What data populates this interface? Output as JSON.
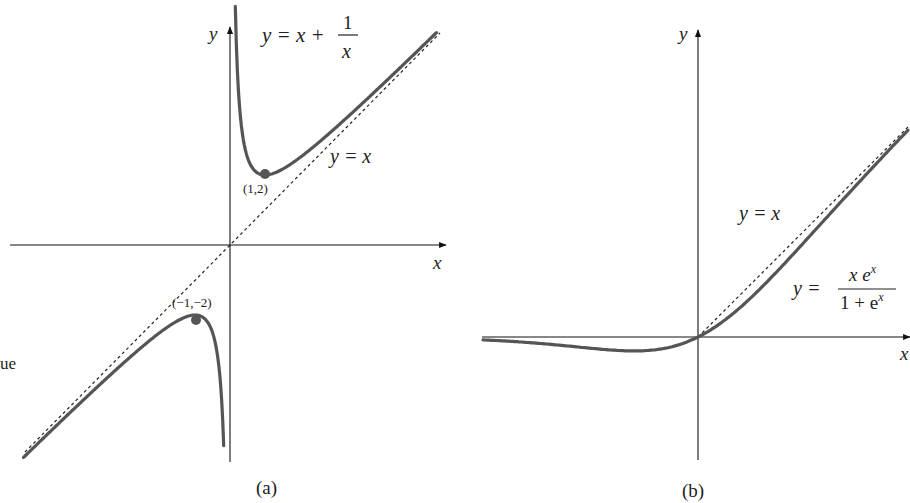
{
  "margin_text": "ue",
  "panels": [
    {
      "id": "a",
      "caption": "(a)",
      "x_axis_label": "x",
      "y_axis_label": "y",
      "equation": {
        "lhs": "y = x + ",
        "num": "1",
        "den": "x"
      },
      "asymptote_label": "y = x",
      "points": [
        {
          "label": "(1,2)",
          "x": 1,
          "y": 2
        },
        {
          "label": "(−1,−2)",
          "x": -1,
          "y": -2
        }
      ]
    },
    {
      "id": "b",
      "caption": "(b)",
      "x_axis_label": "x",
      "y_axis_label": "y",
      "equation": {
        "lhs": "y = ",
        "num": "x e",
        "num_sup": "x",
        "den": "1 + e",
        "den_sup": "x"
      },
      "asymptote_label": "y = x"
    }
  ],
  "chart_data": [
    {
      "type": "line",
      "title": "(a)",
      "xlabel": "x",
      "ylabel": "y",
      "grid": false,
      "xlim": [
        -6.0,
        6.0
      ],
      "ylim": [
        -6.3,
        7.0
      ],
      "series": [
        {
          "name": "y = x + 1/x",
          "style": "solid",
          "x": [
            -5.9,
            -5,
            -4,
            -3,
            -2,
            -1.5,
            -1,
            -0.7,
            -0.5,
            -0.35,
            -0.25,
            -0.18
          ],
          "y": [
            -6.07,
            -5.2,
            -4.25,
            -3.33,
            -2.5,
            -2.17,
            -2,
            -2.13,
            -2.5,
            -3.21,
            -4.25,
            -5.74
          ]
        },
        {
          "name": "y = x + 1/x",
          "style": "solid",
          "x": [
            0.15,
            0.2,
            0.3,
            0.5,
            0.7,
            1,
            1.5,
            2,
            3,
            4,
            5,
            5.9
          ],
          "y": [
            6.82,
            5.2,
            3.63,
            2.5,
            2.13,
            2,
            2.17,
            2.5,
            3.33,
            4.25,
            5.2,
            6.07
          ]
        },
        {
          "name": "y = x",
          "style": "dashed",
          "x": [
            -5.9,
            6.0
          ],
          "y": [
            -5.9,
            6.0
          ]
        }
      ],
      "points": [
        {
          "label": "(1,2)",
          "x": 1,
          "y": 2
        },
        {
          "label": "(-1,-2)",
          "x": -1,
          "y": -2
        }
      ],
      "annotations": [
        "y = x + 1/x",
        "y = x",
        "(1,2)",
        "(-1,-2)"
      ]
    },
    {
      "type": "line",
      "title": "(b)",
      "xlabel": "x",
      "ylabel": "y",
      "grid": false,
      "xlim": [
        -4.3,
        4.2
      ],
      "ylim": [
        -2.4,
        6.2
      ],
      "series": [
        {
          "name": "y = x e^x / (1 + e^x)",
          "style": "solid",
          "x": [
            -4.3,
            -4,
            -3,
            -2.5,
            -2,
            -1.5,
            -1.28,
            -1,
            -0.5,
            0,
            0.5,
            1,
            1.5,
            2,
            2.5,
            3,
            3.5,
            4,
            4.2
          ],
          "y": [
            -0.058,
            -0.072,
            -0.142,
            -0.19,
            -0.238,
            -0.273,
            -0.278,
            -0.269,
            -0.189,
            0,
            0.311,
            0.731,
            1.227,
            1.762,
            2.309,
            2.857,
            3.395,
            3.928,
            4.138
          ]
        },
        {
          "name": "y = x",
          "style": "dashed",
          "x": [
            0,
            4.2
          ],
          "y": [
            0,
            4.2
          ]
        }
      ],
      "annotations": [
        "y = x",
        "y = x e^x / (1 + e^x)"
      ]
    }
  ]
}
